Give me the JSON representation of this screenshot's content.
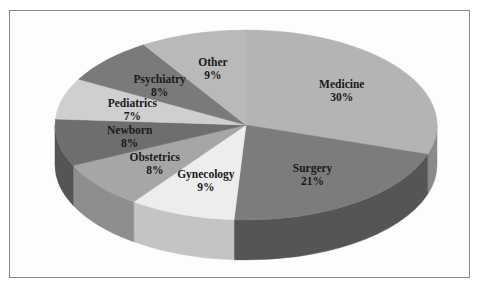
{
  "chart_data": {
    "type": "pie",
    "style": "3d",
    "title": "",
    "start": "12 o'clock",
    "direction": "clockwise",
    "slices": [
      {
        "label": "Medicine",
        "value": 30,
        "value_label": "30%",
        "color": "#b4b4b4",
        "side_color": "#8a8a8a"
      },
      {
        "label": "Surgery",
        "value": 21,
        "value_label": "21%",
        "color": "#7c7c7c",
        "side_color": "#555555"
      },
      {
        "label": "Gynecology",
        "value": 9,
        "value_label": "9%",
        "color": "#ededed",
        "side_color": "#c4c4c4"
      },
      {
        "label": "Obstetrics",
        "value": 8,
        "value_label": "8%",
        "color": "#a6a6a6",
        "side_color": "#8e8e8e"
      },
      {
        "label": "Newborn",
        "value": 8,
        "value_label": "8%",
        "color": "#6e6e6e",
        "side_color": "#555555"
      },
      {
        "label": "Pediatrics",
        "value": 7,
        "value_label": "7%",
        "color": "#cfcfcf",
        "side_color": "#a8a8a8"
      },
      {
        "label": "Psychiatry",
        "value": 8,
        "value_label": "8%",
        "color": "#7a7a7a",
        "side_color": "#5a5a5a"
      },
      {
        "label": "Other",
        "value": 9,
        "value_label": "9%",
        "color": "#b9b9b9",
        "side_color": "#949494"
      }
    ],
    "legend": "none"
  }
}
